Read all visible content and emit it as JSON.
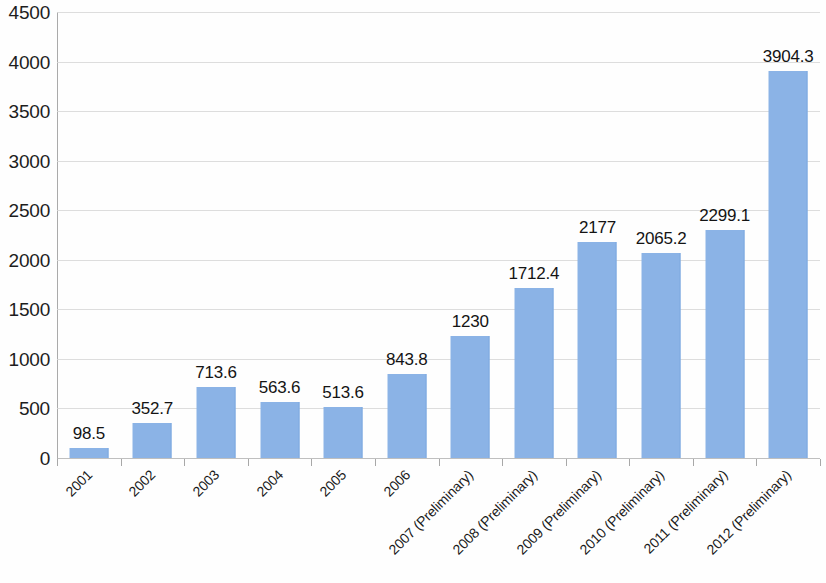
{
  "chart_data": {
    "type": "bar",
    "title": "",
    "subtitle": "",
    "xlabel": "",
    "ylabel": "",
    "ylim": [
      0,
      4500
    ],
    "ytick_step": 500,
    "yticks": [
      4500,
      4000,
      3500,
      3000,
      2500,
      2000,
      1500,
      1000,
      500,
      0
    ],
    "ytick_labels": [
      "4500",
      "4000",
      "3500",
      "3000",
      "2500",
      "2000",
      "1500",
      "1000",
      "500",
      "0"
    ],
    "grid": true,
    "grid_axis": "y",
    "legend": false,
    "legend_position": "none",
    "categories": [
      "2001",
      "2002",
      "2003",
      "2004",
      "2005",
      "2006",
      "2007 (Preliminary)",
      "2008 (Preliminary)",
      "2009 (Preliminary)",
      "2010 (Preliminary)",
      "2011 (Preliminary)",
      "2012 (Preliminary)"
    ],
    "values": [
      98.5,
      352.7,
      713.6,
      563.6,
      513.6,
      843.8,
      1230,
      1712.4,
      2177,
      2065.2,
      2299.1,
      3904.3
    ],
    "value_labels": [
      "98.5",
      "352.7",
      "713.6",
      "563.6",
      "513.6",
      "843.8",
      "1230",
      "1712.4",
      "2177",
      "2065.2",
      "2299.1",
      "3904.3"
    ],
    "bar_color": "#8bb3e6",
    "grid_color": "#d7d7d7",
    "axis_color": "#aaaaaa",
    "label_color": "#141414",
    "x_label_rotation": -45
  }
}
